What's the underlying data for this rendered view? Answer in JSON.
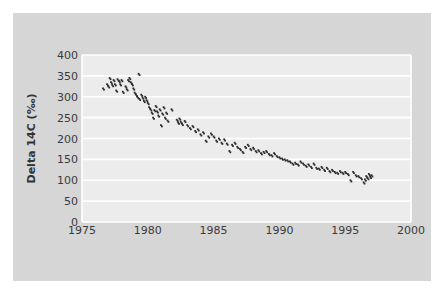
{
  "chart_data": {
    "type": "scatter",
    "title": "",
    "xlabel": "",
    "ylabel": "Delta 14C (‰)",
    "xlim": [
      1975,
      2000
    ],
    "ylim": [
      0,
      400
    ],
    "x_ticks": [
      "1975",
      "1980",
      "1985",
      "1990",
      "1995",
      "2000"
    ],
    "y_ticks": [
      "0",
      "50",
      "100",
      "150",
      "200",
      "250",
      "300",
      "350",
      "400"
    ],
    "grid": true,
    "legend": null,
    "marker_color": "#2a2a2a",
    "plot_bg": "#ececec",
    "card_bg": "#d6d6d6",
    "series": [
      {
        "name": "Delta 14C",
        "points": [
          [
            1976.6,
            320
          ],
          [
            1976.9,
            330
          ],
          [
            1977.0,
            325
          ],
          [
            1977.1,
            345
          ],
          [
            1977.2,
            335
          ],
          [
            1977.3,
            328
          ],
          [
            1977.4,
            340
          ],
          [
            1977.5,
            330
          ],
          [
            1977.6,
            315
          ],
          [
            1977.7,
            342
          ],
          [
            1977.8,
            338
          ],
          [
            1977.9,
            330
          ],
          [
            1978.0,
            340
          ],
          [
            1978.1,
            312
          ],
          [
            1978.3,
            325
          ],
          [
            1978.4,
            318
          ],
          [
            1978.5,
            340
          ],
          [
            1978.6,
            345
          ],
          [
            1978.7,
            335
          ],
          [
            1978.8,
            330
          ],
          [
            1978.9,
            320
          ],
          [
            1979.0,
            310
          ],
          [
            1979.1,
            305
          ],
          [
            1979.2,
            300
          ],
          [
            1979.3,
            355
          ],
          [
            1979.35,
            295
          ],
          [
            1979.5,
            305
          ],
          [
            1979.6,
            298
          ],
          [
            1979.7,
            290
          ],
          [
            1979.8,
            300
          ],
          [
            1979.9,
            292
          ],
          [
            1980.0,
            285
          ],
          [
            1980.1,
            275
          ],
          [
            1980.2,
            270
          ],
          [
            1980.3,
            262
          ],
          [
            1980.4,
            250
          ],
          [
            1980.5,
            268
          ],
          [
            1980.6,
            278
          ],
          [
            1980.7,
            265
          ],
          [
            1980.8,
            255
          ],
          [
            1980.9,
            270
          ],
          [
            1981.0,
            232
          ],
          [
            1981.1,
            260
          ],
          [
            1981.2,
            275
          ],
          [
            1981.3,
            250
          ],
          [
            1981.4,
            262
          ],
          [
            1981.5,
            243
          ],
          [
            1981.8,
            270
          ],
          [
            1982.2,
            245
          ],
          [
            1982.3,
            238
          ],
          [
            1982.4,
            248
          ],
          [
            1982.5,
            240
          ],
          [
            1982.6,
            235
          ],
          [
            1982.8,
            242
          ],
          [
            1983.0,
            232
          ],
          [
            1983.2,
            225
          ],
          [
            1983.4,
            230
          ],
          [
            1983.6,
            218
          ],
          [
            1983.8,
            222
          ],
          [
            1984.0,
            210
          ],
          [
            1984.2,
            215
          ],
          [
            1984.4,
            195
          ],
          [
            1984.6,
            205
          ],
          [
            1984.8,
            212
          ],
          [
            1985.0,
            205
          ],
          [
            1985.2,
            195
          ],
          [
            1985.4,
            200
          ],
          [
            1985.6,
            190
          ],
          [
            1985.8,
            198
          ],
          [
            1986.0,
            188
          ],
          [
            1986.2,
            170
          ],
          [
            1986.4,
            185
          ],
          [
            1986.6,
            190
          ],
          [
            1986.8,
            180
          ],
          [
            1987.0,
            175
          ],
          [
            1987.2,
            168
          ],
          [
            1987.4,
            180
          ],
          [
            1987.6,
            185
          ],
          [
            1987.8,
            175
          ],
          [
            1988.0,
            178
          ],
          [
            1988.2,
            170
          ],
          [
            1988.4,
            172
          ],
          [
            1988.6,
            165
          ],
          [
            1988.8,
            168
          ],
          [
            1989.0,
            170
          ],
          [
            1989.2,
            163
          ],
          [
            1989.4,
            160
          ],
          [
            1989.6,
            165
          ],
          [
            1989.8,
            158
          ],
          [
            1990.0,
            155
          ],
          [
            1990.2,
            152
          ],
          [
            1990.4,
            150
          ],
          [
            1990.6,
            148
          ],
          [
            1990.8,
            145
          ],
          [
            1991.0,
            140
          ],
          [
            1991.2,
            142
          ],
          [
            1991.4,
            138
          ],
          [
            1991.6,
            145
          ],
          [
            1991.8,
            140
          ],
          [
            1992.0,
            135
          ],
          [
            1992.2,
            138
          ],
          [
            1992.4,
            132
          ],
          [
            1992.6,
            140
          ],
          [
            1992.8,
            130
          ],
          [
            1993.0,
            128
          ],
          [
            1993.2,
            132
          ],
          [
            1993.4,
            125
          ],
          [
            1993.6,
            130
          ],
          [
            1993.8,
            122
          ],
          [
            1994.0,
            125
          ],
          [
            1994.2,
            120
          ],
          [
            1994.4,
            118
          ],
          [
            1994.6,
            122
          ],
          [
            1994.8,
            118
          ],
          [
            1995.0,
            120
          ],
          [
            1995.2,
            115
          ],
          [
            1995.4,
            100
          ],
          [
            1995.6,
            120
          ],
          [
            1995.8,
            112
          ],
          [
            1996.0,
            110
          ],
          [
            1996.2,
            105
          ],
          [
            1996.4,
            95
          ],
          [
            1996.5,
            102
          ],
          [
            1996.6,
            110
          ],
          [
            1996.7,
            105
          ],
          [
            1996.8,
            115
          ],
          [
            1996.9,
            108
          ],
          [
            1997.0,
            112
          ]
        ]
      }
    ]
  }
}
